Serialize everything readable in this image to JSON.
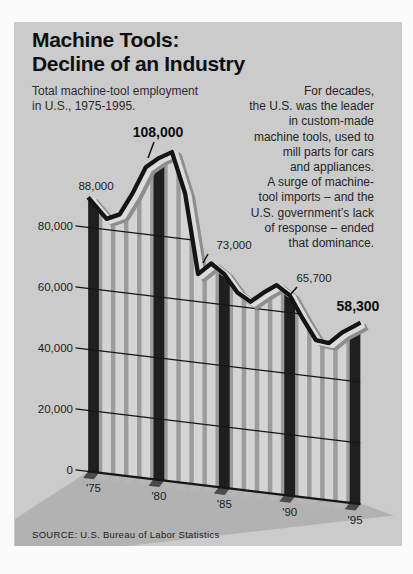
{
  "title": {
    "line1": "Machine Tools:",
    "line2": "Decline of an Industry"
  },
  "subtitle": {
    "line1": "Total machine-tool employment",
    "line2": "in U.S., 1975-1995."
  },
  "intro": {
    "lines": [
      "For decades,",
      "the U.S. was the leader",
      "in custom-made",
      "machine tools, used to",
      "mill parts for cars",
      "and appliances.",
      "A surge of machine-",
      "tool imports – and the",
      "U.S. government’s lack",
      "of response – ended",
      "that dominance."
    ]
  },
  "source": "SOURCE:  U.S. Bureau of Labor Statistics",
  "chart_data": {
    "type": "area",
    "title": "Machine Tools: Decline of an Industry",
    "subtitle": "Total machine-tool employment in U.S., 1975-1995.",
    "x": [
      1975,
      1976,
      1977,
      1978,
      1979,
      1980,
      1981,
      1982,
      1983,
      1984,
      1985,
      1986,
      1987,
      1988,
      1989,
      1990,
      1991,
      1992,
      1993,
      1994,
      1995
    ],
    "values": [
      88000,
      83500,
      85500,
      93000,
      102000,
      105500,
      108000,
      95000,
      69000,
      73000,
      70000,
      64500,
      62000,
      65500,
      68500,
      65700,
      58500,
      52000,
      51500,
      55500,
      58300
    ],
    "ylim": [
      0,
      110000
    ],
    "grid": "on",
    "yticks": [
      "0",
      "20,000",
      "40,000",
      "60,000",
      "80,000"
    ],
    "ytick_values": [
      0,
      20000,
      40000,
      60000,
      80000
    ],
    "xticks": [
      "'75",
      "'80",
      "'85",
      "'90",
      "'95"
    ],
    "callouts": [
      {
        "year": 1975,
        "label": "88,000",
        "bold": false
      },
      {
        "year": 1981,
        "label": "108,000",
        "bold": true
      },
      {
        "year": 1984,
        "label": "73,000",
        "bold": false
      },
      {
        "year": 1990,
        "label": "65,700",
        "bold": false
      },
      {
        "year": 1995,
        "label": "58,300",
        "bold": true
      }
    ],
    "colors": {
      "panel": "#cbcbcb",
      "shadow": "#b2b2b2",
      "area": "#9c9c9c",
      "bar_light": "#d4d4d4",
      "bar_dark": "#1f1f1f",
      "foot_light": "#b6b6b6",
      "foot_dark": "#4a4a4a",
      "grid": "#161616",
      "line": "#141414",
      "bevel_light": "#dcdcdc",
      "bevel_shadow": "#8e8e8e"
    }
  }
}
